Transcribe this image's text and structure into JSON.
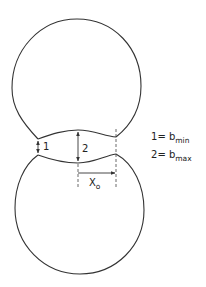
{
  "diagram": {
    "type": "two-lobe droplet profile with neck dimensions",
    "dimension_labels": {
      "neck_min_label": "1",
      "neck_max_label": "2",
      "offset_label_base": "X",
      "offset_label_sub": "o"
    },
    "legend": [
      {
        "key": "1",
        "eq": "= b",
        "sub": "min"
      },
      {
        "key": "2",
        "eq": "= b",
        "sub": "max"
      }
    ],
    "colors": {
      "line": "#333333",
      "background": "#ffffff"
    }
  }
}
